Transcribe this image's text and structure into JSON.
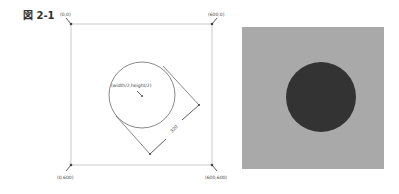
{
  "figure": {
    "label": "図 2-1"
  },
  "diagram": {
    "corners": {
      "top_left": "(0,0)",
      "top_right": "(600,0)",
      "bottom_left": "(0,600)",
      "bottom_right": "(600,600)"
    },
    "center_label": "(width/2,height/2)",
    "dimension_label": "320"
  },
  "render": {
    "background_color": "#a9a9a9",
    "circle_color": "#333333"
  }
}
